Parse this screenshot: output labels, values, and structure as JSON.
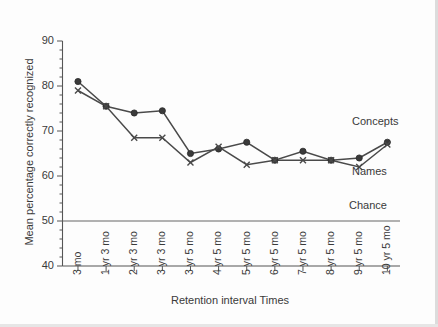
{
  "chart_data": {
    "type": "line",
    "title": "",
    "xlabel": "Retention interval Times",
    "ylabel": "Mean percentage correctly recognized",
    "categories": [
      "3 mo",
      "1 yr 3 mo",
      "2 yr 3 mo",
      "3 yr 3 mo",
      "3 yr 5 mo",
      "4 yr 5 mo",
      "5 yr 5 mo",
      "6 yr 5 mo",
      "7 yr 5 mo",
      "8 yr 5 mo",
      "9 yr 5 mo",
      "10 yr 5 mo"
    ],
    "series": [
      {
        "name": "Concepts",
        "marker": "circle",
        "values": [
          81.0,
          75.5,
          74.0,
          74.5,
          65.0,
          66.0,
          67.5,
          63.5,
          65.5,
          63.5,
          64.0,
          67.5
        ]
      },
      {
        "name": "Names",
        "marker": "x",
        "values": [
          79.0,
          75.5,
          68.5,
          68.5,
          63.0,
          66.5,
          62.5,
          63.5,
          63.5,
          63.5,
          62.0,
          67.0
        ]
      }
    ],
    "ylim": [
      40,
      90
    ],
    "yticks": [
      40,
      50,
      60,
      70,
      80,
      90
    ],
    "ytick_labels": [
      "40",
      "50",
      "60",
      "70",
      "80",
      "90"
    ],
    "grid": false,
    "legend_position": "inline-right",
    "annotations": [
      {
        "name": "chance",
        "label": "Chance",
        "type": "hline",
        "value": 50
      },
      {
        "name": "concepts-label",
        "label": "Concepts",
        "type": "series-label"
      },
      {
        "name": "names-label",
        "label": "Names",
        "type": "series-label"
      }
    ],
    "colors": {
      "concepts": "#3a3a3a",
      "names": "#4a4a4a",
      "axis": "#555555",
      "chance": "#666666"
    }
  }
}
